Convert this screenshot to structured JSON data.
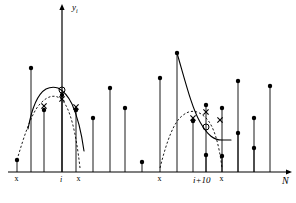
{
  "figure": {
    "axes": {
      "y_label": "y",
      "y_label_sub": "i",
      "x_label": "N",
      "x_axis_y": 172,
      "y_axis_x": 62,
      "x_axis_x_start": 8,
      "x_axis_x_end": 286,
      "y_axis_y_top": 10
    },
    "tick_labels": [
      {
        "name": "tick-label-i",
        "text": "i",
        "x": 62,
        "y": 176
      },
      {
        "name": "tick-label-i-plus-10",
        "text": "i+10",
        "x": 206,
        "y": 176
      }
    ],
    "axis_x_markers": [
      {
        "name": "window-marker-left-1",
        "text": "x",
        "x": 17,
        "y": 175
      },
      {
        "name": "window-marker-right-1",
        "text": "x",
        "x": 79,
        "y": 175
      },
      {
        "name": "window-marker-left-2",
        "text": "x",
        "x": 160,
        "y": 175
      },
      {
        "name": "window-marker-right-2",
        "text": "x",
        "x": 222,
        "y": 175
      }
    ],
    "stems": [
      {
        "x": 17,
        "y": 160
      },
      {
        "x": 31,
        "y": 68
      },
      {
        "x": 44,
        "y": 110
      },
      {
        "x": 62,
        "y": 95
      },
      {
        "x": 76,
        "y": 110
      },
      {
        "x": 93,
        "y": 118
      },
      {
        "x": 110,
        "y": 88
      },
      {
        "x": 125,
        "y": 108
      },
      {
        "x": 142,
        "y": 162
      },
      {
        "x": 160,
        "y": 78
      },
      {
        "x": 177,
        "y": 53
      },
      {
        "x": 193,
        "y": 121
      },
      {
        "x": 206,
        "y": 105
      },
      {
        "x": 206,
        "y": 155
      },
      {
        "x": 222,
        "y": 108
      },
      {
        "x": 222,
        "y": 156
      },
      {
        "x": 238,
        "y": 133
      },
      {
        "x": 238,
        "y": 81
      },
      {
        "x": 254,
        "y": 118
      },
      {
        "x": 254,
        "y": 148
      },
      {
        "x": 270,
        "y": 86
      }
    ],
    "solid_curve_1": "M 28 129 Q 34 96 46 89 Q 52 86 58 88 Q 66 92 72 104 Q 80 122 84 151",
    "solid_curve_2": "M 177 53 C 186 84 192 108 200 122 C 208 136 214 140 222 140 L 231 140",
    "dashed_curve_1": "M 17 160 C 24 136 32 112 40 104 C 48 95 56 94 62 100 C 70 108 76 132 80 168",
    "dashed_curve_2": "M 160 168 C 167 140 174 122 182 116 C 190 109 198 110 206 118 C 214 126 219 144 222 168",
    "circle_markers": [
      {
        "name": "interpolated-peak-marker-left",
        "x": 62,
        "y": 90
      },
      {
        "name": "interpolated-peak-marker-right",
        "x": 206,
        "y": 127
      }
    ],
    "x_curve_markers": [
      {
        "name": "curve-sample-marker-1",
        "x": 44,
        "y": 106
      },
      {
        "name": "curve-sample-marker-2",
        "x": 62,
        "y": 99
      },
      {
        "name": "curve-sample-marker-3",
        "x": 76,
        "y": 107
      },
      {
        "name": "curve-sample-marker-4",
        "x": 193,
        "y": 118
      },
      {
        "name": "curve-sample-marker-5",
        "x": 206,
        "y": 112
      },
      {
        "name": "curve-sample-marker-6",
        "x": 220,
        "y": 120
      }
    ],
    "caption": "",
    "colors": {
      "ink": "#000000",
      "background": "#ffffff",
      "caption": "#d8d8d8"
    }
  }
}
